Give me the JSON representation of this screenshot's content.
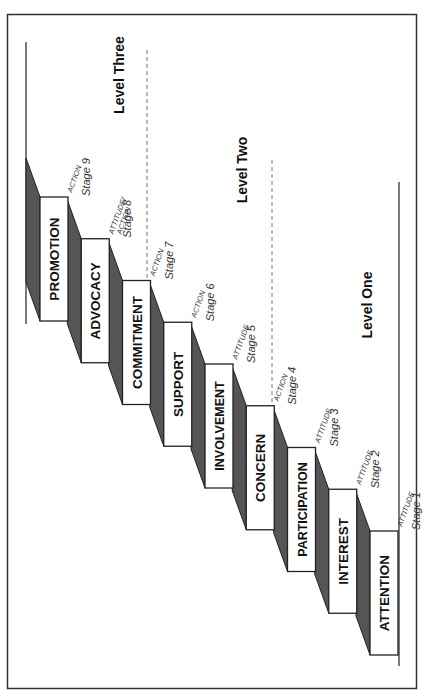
{
  "diagram": {
    "title": "",
    "orientation": "rotated-90-ccw",
    "colors": {
      "border": "#333333",
      "box_fill": "#ffffff",
      "box_stroke": "#222222",
      "side_fill": "#555555",
      "dashed": "#777777",
      "text": "#111111"
    },
    "steps": [
      {
        "stage": "Stage 1",
        "label": "ATTENTION",
        "type": [
          "ATTITUDE"
        ]
      },
      {
        "stage": "Stage 2",
        "label": "INTEREST",
        "type": [
          "ATTITUDE"
        ]
      },
      {
        "stage": "Stage 3",
        "label": "PARTICIPATION",
        "type": [
          "ATTITUDE"
        ]
      },
      {
        "stage": "Stage 4",
        "label": "CONCERN",
        "type": [
          "ACTION"
        ]
      },
      {
        "stage": "Stage 5",
        "label": "INVOLVEMENT",
        "type": [
          "ATTITUDE"
        ]
      },
      {
        "stage": "Stage 6",
        "label": "SUPPORT",
        "type": [
          "ACTION"
        ]
      },
      {
        "stage": "Stage 7",
        "label": "COMMITMENT",
        "type": [
          "ACTION"
        ]
      },
      {
        "stage": "Stage 8",
        "label": "ADVOCACY",
        "type": [
          "ATTITUDE/",
          "ACTION"
        ]
      },
      {
        "stage": "Stage 9",
        "label": "PROMOTION",
        "type": [
          "ACTION"
        ]
      }
    ],
    "levels": [
      {
        "label": "Level One"
      },
      {
        "label": "Level Two"
      },
      {
        "label": "Level Three"
      }
    ]
  }
}
